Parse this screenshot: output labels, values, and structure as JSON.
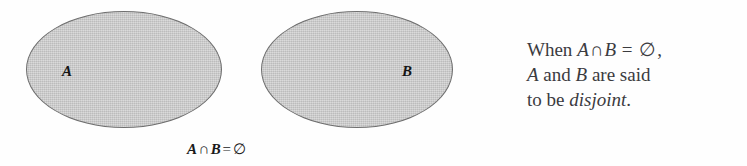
{
  "figure": {
    "background_color": "#fefefe",
    "sets": [
      {
        "id": "A",
        "label": "A",
        "fill_color": "#c6c6c6",
        "stroke_color": "#6f6f6f"
      },
      {
        "id": "B",
        "label": "B",
        "fill_color": "#c6c6c6",
        "stroke_color": "#6f6f6f"
      }
    ],
    "caption": {
      "left_operand": "A",
      "operator": "∩",
      "right_operand": "B",
      "equals": "=",
      "result": "∅",
      "full_text": "A ∩ B = ∅"
    },
    "note": {
      "line1": {
        "prefix": "When",
        "var1": "A",
        "operator": "∩",
        "var2": "B",
        "equals": "=",
        "result": "∅",
        "suffix": ","
      },
      "line2": {
        "var1": "A",
        "conjunction": "and",
        "var2": "B",
        "text": "are said"
      },
      "line3": {
        "prefix": "to be",
        "emphasis": "disjoint",
        "suffix": "."
      },
      "full_text": "When A ∩ B = ∅, A and B are said to be disjoint.",
      "text_color": "#3b3b3f"
    }
  }
}
